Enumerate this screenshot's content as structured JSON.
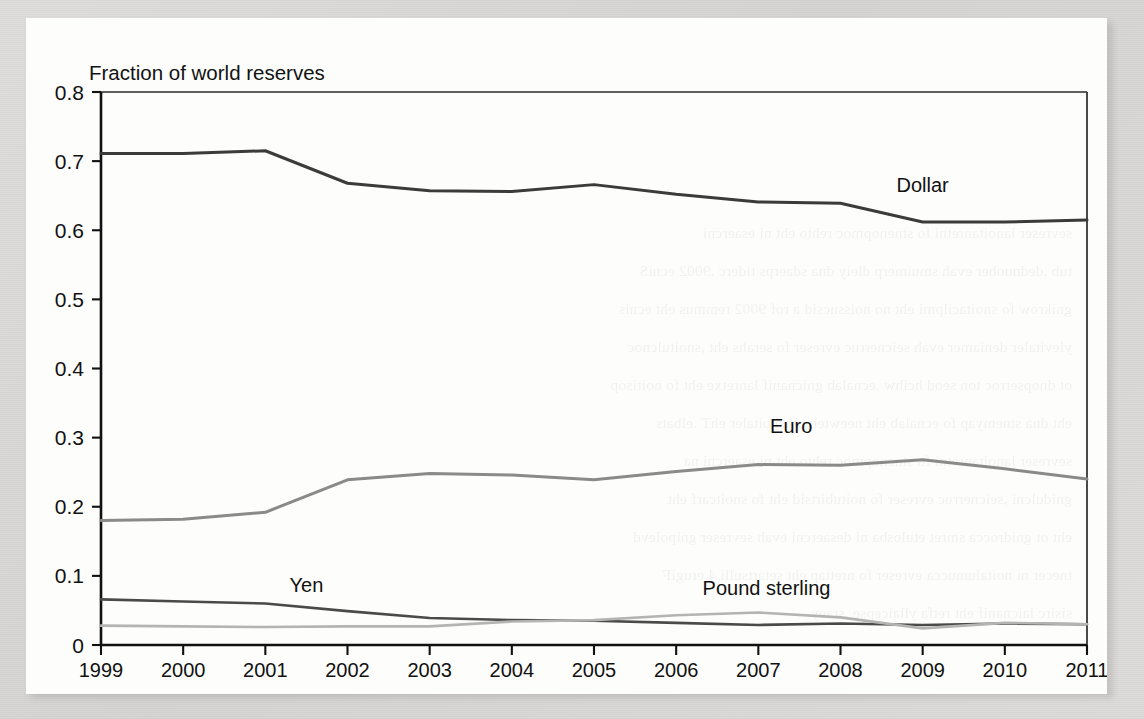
{
  "figure": {
    "panel_background": "#fdfdfc",
    "page_margin_color": "#d8d8d6",
    "title": "Fraction of world reserves"
  },
  "chart_data": {
    "type": "line",
    "title": "Fraction of world reserves",
    "xlabel": "",
    "ylabel": "Fraction of world reserves",
    "x": [
      1999,
      2000,
      2001,
      2002,
      2003,
      2004,
      2005,
      2006,
      2007,
      2008,
      2009,
      2010,
      2011
    ],
    "categories": [
      "1999",
      "2000",
      "2001",
      "2002",
      "2003",
      "2004",
      "2005",
      "2006",
      "2007",
      "2008",
      "2009",
      "2010",
      "2011"
    ],
    "xlim": [
      1999,
      2011
    ],
    "ylim": [
      0,
      0.8
    ],
    "ytick_labels": [
      "0",
      "0.1",
      "0.2",
      "0.3",
      "0.4",
      "0.5",
      "0.6",
      "0.7",
      "0.8"
    ],
    "ytick_values": [
      0,
      0.1,
      0.2,
      0.3,
      0.4,
      0.5,
      0.6,
      0.7,
      0.8
    ],
    "grid": false,
    "legend_position": "inline-labels",
    "series": [
      {
        "name": "Dollar",
        "color": "#3b3b3b",
        "width": 3.0,
        "label_x": 2009.0,
        "label_y": 0.655,
        "values": [
          0.711,
          0.711,
          0.715,
          0.668,
          0.657,
          0.656,
          0.666,
          0.652,
          0.641,
          0.639,
          0.612,
          0.612,
          0.615
        ]
      },
      {
        "name": "Euro",
        "color": "#8a8a8a",
        "width": 3.0,
        "label_x": 2007.4,
        "label_y": 0.307,
        "values": [
          0.18,
          0.182,
          0.192,
          0.239,
          0.248,
          0.246,
          0.239,
          0.251,
          0.261,
          0.26,
          0.268,
          0.255,
          0.24
        ]
      },
      {
        "name": "Yen",
        "color": "#4a4a4a",
        "width": 2.6,
        "label_x": 2001.5,
        "label_y": 0.076,
        "values": [
          0.066,
          0.063,
          0.06,
          0.049,
          0.039,
          0.036,
          0.035,
          0.032,
          0.029,
          0.031,
          0.029,
          0.031,
          0.03
        ]
      },
      {
        "name": "Pound sterling",
        "color": "#b4b4b4",
        "width": 2.6,
        "label_x": 2007.1,
        "label_y": 0.072,
        "values": [
          0.028,
          0.027,
          0.026,
          0.027,
          0.027,
          0.034,
          0.036,
          0.043,
          0.047,
          0.04,
          0.024,
          0.032,
          0.03
        ]
      }
    ]
  },
  "ghost_lines": [
    "sevreser lanoitanretni fo stnenopmoc rehto eht ni esaercni",
    "tub ,dednuober evah smuimerp dleiy dna sdaerps tiderc ,9002 ecniS",
    "gnikrow fo snoitacilpmi eht no noissucsid a rof 9002 remmus eht ecnis",
    "ylevitaler deniamer evah seicnerruc evreser fo serahs eht ,snoitulcnoc",
    "ot dnopserroc ton seod hcihw ,ecnalab gnicnanif lanretxe eht fo noitisop",
    "eht dna stnemyap fo ecnalab eht neewteb pihsnoitaler ehT .elbats",
    "sevreser lanoitanretni fo stnenopmoc rehto eht ni esaercni na",
    "gnidulcni ,seicnerruc evreser fo noitubirtsid eht fo snoitcarf eht",
    "eht ot gnidrocca smret etulosba ni desaercni evah sevreser gnipolevd",
    "tnecer ni noitalumucca evreser fo nrettap eht setartsulli 4 erugiF",
    "sisirc laicnanif eht retfa yllaicepse ,sraey"
  ]
}
